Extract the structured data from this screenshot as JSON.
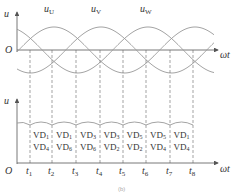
{
  "figure": {
    "top_plot": {
      "y_label": "u",
      "origin_label": "O",
      "x_label": "ωt",
      "curves": [
        {
          "name": "u",
          "sub": "U",
          "label_x": 44,
          "label_y": 9
        },
        {
          "name": "u",
          "sub": "V",
          "label_x": 91,
          "label_y": 9
        },
        {
          "name": "u",
          "sub": "W",
          "label_x": 141,
          "label_y": 9
        }
      ],
      "color": "#888888"
    },
    "bottom_plot": {
      "y_label": "u",
      "origin_label": "O",
      "x_label": "ωt",
      "time_ticks": [
        {
          "t": "t",
          "sub": "1"
        },
        {
          "t": "t",
          "sub": "2"
        },
        {
          "t": "t",
          "sub": "3"
        },
        {
          "t": "t",
          "sub": "4"
        },
        {
          "t": "t",
          "sub": "5"
        },
        {
          "t": "t",
          "sub": "6"
        },
        {
          "t": "t",
          "sub": "7"
        },
        {
          "t": "t",
          "sub": "8"
        }
      ],
      "conducting_pairs": [
        {
          "a": "VD",
          "a_sub": "1",
          "b": "VD",
          "b_sub": "4"
        },
        {
          "a": "VD",
          "a_sub": "1",
          "b": "VD",
          "b_sub": "6"
        },
        {
          "a": "VD",
          "a_sub": "3",
          "b": "VD",
          "b_sub": "6"
        },
        {
          "a": "VD",
          "a_sub": "3",
          "b": "VD",
          "b_sub": "2"
        },
        {
          "a": "VD",
          "a_sub": "5",
          "b": "VD",
          "b_sub": "2"
        },
        {
          "a": "VD",
          "a_sub": "5",
          "b": "VD",
          "b_sub": "4"
        },
        {
          "a": "VD",
          "a_sub": "1",
          "b": "VD",
          "b_sub": "4"
        }
      ]
    },
    "caption": "(b)"
  }
}
